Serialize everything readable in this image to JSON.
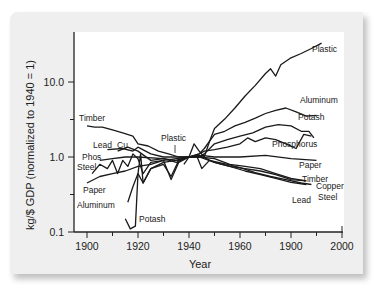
{
  "chart_data": {
    "type": "line",
    "title": "",
    "xlabel": "Year",
    "ylabel": "kg/$ GDP (normalized to 1940 = 1)",
    "yscale": "log",
    "xlim": [
      1895,
      2000
    ],
    "ylim": [
      0.1,
      40
    ],
    "x_tick_labels": [
      "1900",
      "1920",
      "1940",
      "1960",
      "1900",
      "2000"
    ],
    "x_tick_positions": [
      1900,
      1920,
      1940,
      1960,
      1980,
      2000
    ],
    "y_tick_labels": [
      "0.1",
      "1.0",
      "10.0"
    ],
    "y_tick_positions": [
      0.1,
      1.0,
      10.0
    ],
    "grid": false,
    "legend": "inline labels",
    "series": [
      {
        "name": "Plastic",
        "label_pos": [
          1941,
          1.5
        ],
        "points": [
          [
            1938,
            0.8
          ],
          [
            1940,
            1.0
          ],
          [
            1942,
            1.5
          ],
          [
            1944,
            1.2
          ],
          [
            1946,
            1.0
          ],
          [
            1948,
            1.6
          ],
          [
            1950,
            2.4
          ],
          [
            1954,
            3.2
          ],
          [
            1958,
            4.5
          ],
          [
            1962,
            6.5
          ],
          [
            1966,
            9
          ],
          [
            1970,
            13
          ],
          [
            1972,
            15
          ],
          [
            1974,
            12
          ],
          [
            1976,
            17
          ],
          [
            1980,
            21
          ],
          [
            1984,
            24
          ],
          [
            1988,
            28
          ],
          [
            1992,
            33
          ]
        ]
      },
      {
        "name": "Aluminum",
        "label_pos": [
          1905,
          0.22
        ],
        "points": [
          [
            1916,
            0.25
          ],
          [
            1918,
            0.4
          ],
          [
            1920,
            0.6
          ],
          [
            1922,
            0.45
          ],
          [
            1925,
            0.7
          ],
          [
            1930,
            0.8
          ],
          [
            1933,
            0.55
          ],
          [
            1936,
            0.9
          ],
          [
            1940,
            1.0
          ],
          [
            1944,
            1.1
          ],
          [
            1946,
            1.3
          ],
          [
            1950,
            2.0
          ],
          [
            1954,
            2.2
          ],
          [
            1958,
            2.6
          ],
          [
            1962,
            2.9
          ],
          [
            1966,
            3.3
          ],
          [
            1970,
            3.8
          ],
          [
            1974,
            4.2
          ],
          [
            1978,
            4.5
          ],
          [
            1982,
            4.0
          ],
          [
            1986,
            3.5
          ],
          [
            1990,
            3.6
          ]
        ]
      },
      {
        "name": "Potash",
        "label_pos": [
          1921,
          0.12
        ],
        "points": [
          [
            1915,
            0.15
          ],
          [
            1917,
            0.11
          ],
          [
            1919,
            0.12
          ],
          [
            1920,
            0.6
          ],
          [
            1921,
            1.1
          ],
          [
            1922,
            0.45
          ],
          [
            1925,
            0.7
          ],
          [
            1930,
            0.85
          ],
          [
            1935,
            0.9
          ],
          [
            1940,
            1.0
          ],
          [
            1944,
            1.0
          ],
          [
            1946,
            1.1
          ],
          [
            1950,
            1.5
          ],
          [
            1955,
            1.7
          ],
          [
            1960,
            1.9
          ],
          [
            1965,
            2.1
          ],
          [
            1970,
            2.5
          ],
          [
            1975,
            2.7
          ],
          [
            1980,
            2.6
          ],
          [
            1984,
            2.2
          ],
          [
            1987,
            2.2
          ],
          [
            1989,
            1.8
          ]
        ]
      },
      {
        "name": "Phosphorus",
        "label_pos": [
          1906,
          0.95
        ],
        "points": [
          [
            1905,
            0.9
          ],
          [
            1910,
            0.95
          ],
          [
            1915,
            1.0
          ],
          [
            1920,
            1.0
          ],
          [
            1930,
            0.95
          ],
          [
            1935,
            0.9
          ],
          [
            1940,
            1.0
          ],
          [
            1944,
            1.1
          ],
          [
            1946,
            1.2
          ],
          [
            1950,
            1.25
          ],
          [
            1955,
            1.35
          ],
          [
            1960,
            1.5
          ],
          [
            1963,
            1.8
          ],
          [
            1966,
            1.6
          ],
          [
            1970,
            1.8
          ],
          [
            1974,
            1.7
          ],
          [
            1978,
            1.5
          ],
          [
            1982,
            1.3
          ],
          [
            1985,
            2.0
          ],
          [
            1988,
            1.9
          ]
        ]
      },
      {
        "name": "Paper",
        "label_pos": [
          1904,
          0.42
        ],
        "points": [
          [
            1900,
            0.45
          ],
          [
            1905,
            0.55
          ],
          [
            1910,
            0.6
          ],
          [
            1915,
            0.65
          ],
          [
            1920,
            0.75
          ],
          [
            1925,
            0.8
          ],
          [
            1930,
            0.9
          ],
          [
            1935,
            0.95
          ],
          [
            1940,
            1.0
          ],
          [
            1945,
            1.05
          ],
          [
            1950,
            1.0
          ],
          [
            1960,
            1.0
          ],
          [
            1970,
            1.05
          ],
          [
            1980,
            0.95
          ],
          [
            1990,
            0.9
          ]
        ]
      },
      {
        "name": "Timber",
        "label_pos": [
          1900,
          2.6
        ],
        "points": [
          [
            1900,
            2.6
          ],
          [
            1903,
            2.5
          ],
          [
            1906,
            2.5
          ],
          [
            1910,
            2.3
          ],
          [
            1914,
            2.1
          ],
          [
            1918,
            1.9
          ],
          [
            1920,
            1.5
          ],
          [
            1924,
            1.4
          ],
          [
            1928,
            1.2
          ],
          [
            1932,
            1.1
          ],
          [
            1936,
            1.0
          ],
          [
            1940,
            1.0
          ],
          [
            1944,
            1.0
          ],
          [
            1950,
            0.95
          ],
          [
            1956,
            0.8
          ],
          [
            1962,
            0.75
          ],
          [
            1968,
            0.7
          ],
          [
            1974,
            0.6
          ],
          [
            1980,
            0.52
          ],
          [
            1986,
            0.48
          ]
        ]
      },
      {
        "name": "Lead",
        "label_pos": [
          1906,
          1.35
        ],
        "points": [
          [
            1908,
            1.25
          ],
          [
            1914,
            1.3
          ],
          [
            1918,
            1.2
          ],
          [
            1920,
            1.35
          ],
          [
            1925,
            1.1
          ],
          [
            1930,
            1.0
          ],
          [
            1935,
            1.0
          ],
          [
            1940,
            1.0
          ],
          [
            1944,
            1.05
          ],
          [
            1950,
            0.85
          ],
          [
            1956,
            0.75
          ],
          [
            1962,
            0.65
          ],
          [
            1968,
            0.58
          ],
          [
            1974,
            0.52
          ],
          [
            1980,
            0.46
          ],
          [
            1986,
            0.43
          ]
        ]
      },
      {
        "name": "Copper",
        "label_pos": [
          1914,
          1.35
        ],
        "points": [
          [
            1912,
            1.2
          ],
          [
            1916,
            1.35
          ],
          [
            1920,
            1.2
          ],
          [
            1925,
            0.9
          ],
          [
            1930,
            0.95
          ],
          [
            1935,
            0.85
          ],
          [
            1940,
            1.0
          ],
          [
            1944,
            1.0
          ],
          [
            1950,
            0.85
          ],
          [
            1956,
            0.75
          ],
          [
            1962,
            0.7
          ],
          [
            1968,
            0.65
          ],
          [
            1974,
            0.58
          ],
          [
            1980,
            0.5
          ],
          [
            1986,
            0.48
          ]
        ]
      },
      {
        "name": "Steel",
        "label_pos": [
          1900,
          0.85
        ],
        "points": [
          [
            1902,
            0.6
          ],
          [
            1905,
            0.8
          ],
          [
            1908,
            0.7
          ],
          [
            1910,
            0.9
          ],
          [
            1912,
            0.6
          ],
          [
            1914,
            0.9
          ],
          [
            1916,
            0.75
          ],
          [
            1918,
            1.1
          ],
          [
            1920,
            0.95
          ],
          [
            1922,
            0.6
          ],
          [
            1925,
            0.85
          ],
          [
            1930,
            0.9
          ],
          [
            1933,
            0.5
          ],
          [
            1936,
            0.85
          ],
          [
            1940,
            1.0
          ],
          [
            1943,
            1.05
          ],
          [
            1945,
            0.7
          ],
          [
            1948,
            0.9
          ],
          [
            1955,
            0.8
          ],
          [
            1960,
            0.72
          ],
          [
            1966,
            0.62
          ],
          [
            1972,
            0.55
          ],
          [
            1978,
            0.5
          ],
          [
            1984,
            0.45
          ],
          [
            1988,
            0.43
          ]
        ]
      }
    ],
    "annotations": [
      "Timber",
      "Lead",
      "Cu",
      "Phos",
      "Steel",
      "Paper",
      "Aluminum",
      "Potash",
      "Plastic",
      "Plastic",
      "Aluminum",
      "Potash",
      "Phosphorus",
      "Paper",
      "Timber",
      "Copper",
      "Lead",
      "Steel"
    ]
  },
  "axes": {
    "xlabel": "Year",
    "ylabel": "kg/$ GDP (normalized to 1940 = 1)"
  },
  "labels": {
    "left": [
      {
        "text": "Timber",
        "x": 79,
        "y": 121
      },
      {
        "text": "Lead",
        "x": 93,
        "y": 148
      },
      {
        "text": "Cu",
        "x": 117,
        "y": 148
      },
      {
        "text": "Phos",
        "x": 82,
        "y": 160
      },
      {
        "text": "Steel",
        "x": 77,
        "y": 170
      },
      {
        "text": "Paper",
        "x": 83,
        "y": 193
      },
      {
        "text": "Aluminum",
        "x": 77,
        "y": 208
      },
      {
        "text": "Potash",
        "x": 139,
        "y": 222
      },
      {
        "text": "Plastic",
        "x": 161,
        "y": 141
      }
    ],
    "right": [
      {
        "text": "Plastic",
        "x": 312,
        "y": 52
      },
      {
        "text": "Aluminum",
        "x": 300,
        "y": 103
      },
      {
        "text": "Potash",
        "x": 298,
        "y": 120
      },
      {
        "text": "Phosphorus",
        "x": 272,
        "y": 147
      },
      {
        "text": "Paper",
        "x": 299,
        "y": 168
      },
      {
        "text": "Timber",
        "x": 302,
        "y": 182
      },
      {
        "text": "Copper",
        "x": 316,
        "y": 189
      },
      {
        "text": "Lead",
        "x": 292,
        "y": 203
      },
      {
        "text": "Steel",
        "x": 318,
        "y": 200
      }
    ]
  }
}
